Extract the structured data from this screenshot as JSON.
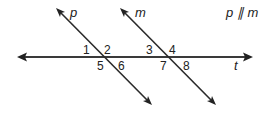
{
  "diagram": {
    "type": "parallel-lines-transversal",
    "lines": {
      "p": {
        "label": "p",
        "from": [
          56,
          8
        ],
        "to": [
          152,
          105
        ]
      },
      "m": {
        "label": "m",
        "from": [
          120,
          8
        ],
        "to": [
          216,
          105
        ]
      },
      "t": {
        "label": "t",
        "from": [
          18,
          57
        ],
        "to": [
          252,
          57
        ]
      }
    },
    "relation": "p ∥ m",
    "angles": [
      {
        "id": "1",
        "x": 83,
        "y": 54
      },
      {
        "id": "2",
        "x": 104,
        "y": 54
      },
      {
        "id": "3",
        "x": 146,
        "y": 54
      },
      {
        "id": "4",
        "x": 169,
        "y": 54
      },
      {
        "id": "5",
        "x": 97,
        "y": 70
      },
      {
        "id": "6",
        "x": 118,
        "y": 70
      },
      {
        "id": "7",
        "x": 160,
        "y": 70
      },
      {
        "id": "8",
        "x": 183,
        "y": 70
      }
    ],
    "colors": {
      "line": "#2a2a2a",
      "text": "#222222",
      "background": "#ffffff"
    }
  }
}
